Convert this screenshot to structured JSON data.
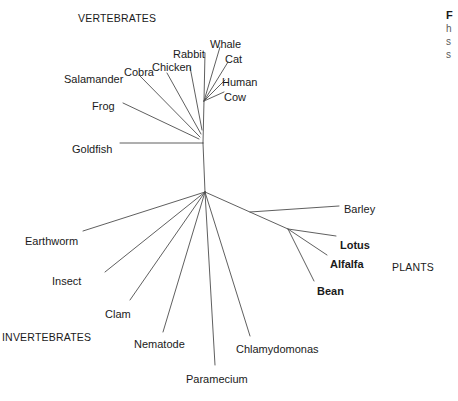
{
  "figure": {
    "type": "unrooted-phylogenetic-tree",
    "background_color": "#ffffff",
    "line_color": "#4d4d4d",
    "text_color": "#1a1a1a"
  },
  "group_labels": [
    {
      "name": "vertebrates",
      "text": "VERTEBRATES",
      "x": 78,
      "y": 12
    },
    {
      "name": "invertebrates",
      "text": "INVERTEBRATES",
      "x": 2,
      "y": 331
    },
    {
      "name": "plants",
      "text": "PLANTS",
      "x": 392,
      "y": 261
    }
  ],
  "tips": [
    {
      "name": "whale",
      "label": "Whale",
      "bold": false,
      "x": 210,
      "y": 38,
      "anchor": "start"
    },
    {
      "name": "rabbit",
      "label": "Rabbit",
      "bold": false,
      "x": 173,
      "y": 48,
      "anchor": "start"
    },
    {
      "name": "cat",
      "label": "Cat",
      "bold": false,
      "x": 225,
      "y": 53,
      "anchor": "start"
    },
    {
      "name": "chicken",
      "label": "Chicken",
      "bold": false,
      "x": 152,
      "y": 61,
      "anchor": "start"
    },
    {
      "name": "cobra",
      "label": "Cobra",
      "bold": false,
      "x": 124,
      "y": 66,
      "anchor": "start"
    },
    {
      "name": "human",
      "label": "Human",
      "bold": false,
      "x": 222,
      "y": 76,
      "anchor": "start"
    },
    {
      "name": "salamander",
      "label": "Salamander",
      "bold": false,
      "x": 64,
      "y": 73,
      "anchor": "start"
    },
    {
      "name": "cow",
      "label": "Cow",
      "bold": false,
      "x": 224,
      "y": 91,
      "anchor": "start"
    },
    {
      "name": "frog",
      "label": "Frog",
      "bold": false,
      "x": 92,
      "y": 100,
      "anchor": "start"
    },
    {
      "name": "goldfish",
      "label": "Goldfish",
      "bold": false,
      "x": 72,
      "y": 143,
      "anchor": "start"
    },
    {
      "name": "barley",
      "label": "Barley",
      "bold": false,
      "x": 344,
      "y": 203,
      "anchor": "start"
    },
    {
      "name": "earthworm",
      "label": "Earthworm",
      "bold": false,
      "x": 25,
      "y": 235,
      "anchor": "start"
    },
    {
      "name": "lotus",
      "label": "Lotus",
      "bold": true,
      "x": 340,
      "y": 239,
      "anchor": "start"
    },
    {
      "name": "alfalfa",
      "label": "Alfalfa",
      "bold": true,
      "x": 330,
      "y": 258,
      "anchor": "start"
    },
    {
      "name": "insect",
      "label": "Insect",
      "bold": false,
      "x": 52,
      "y": 275,
      "anchor": "start"
    },
    {
      "name": "bean",
      "label": "Bean",
      "bold": true,
      "x": 317,
      "y": 285,
      "anchor": "start"
    },
    {
      "name": "clam",
      "label": "Clam",
      "bold": false,
      "x": 105,
      "y": 308,
      "anchor": "start"
    },
    {
      "name": "nematode",
      "label": "Nematode",
      "bold": false,
      "x": 134,
      "y": 338,
      "anchor": "start"
    },
    {
      "name": "chlamydomonas",
      "label": "Chlamydomonas",
      "bold": false,
      "x": 236,
      "y": 343,
      "anchor": "start"
    },
    {
      "name": "paramecium",
      "label": "Paramecium",
      "bold": false,
      "x": 186,
      "y": 373,
      "anchor": "start"
    }
  ],
  "nodes": {
    "root": {
      "x": 205,
      "y": 192
    },
    "vertebrate": {
      "x": 203,
      "y": 143
    },
    "mammal": {
      "x": 204,
      "y": 101
    },
    "plant": {
      "x": 288,
      "y": 229
    }
  },
  "branches": [
    {
      "name": "branch-root-to-vertebrate",
      "x1": 205,
      "y1": 192,
      "x2": 203,
      "y2": 143
    },
    {
      "name": "branch-vertebrate-to-mammal",
      "x1": 203,
      "y1": 143,
      "x2": 204,
      "y2": 101
    },
    {
      "name": "branch-goldfish",
      "x1": 203,
      "y1": 143,
      "x2": 120,
      "y2": 143
    },
    {
      "name": "branch-frog",
      "x1": 199,
      "y1": 139,
      "x2": 123,
      "y2": 103
    },
    {
      "name": "branch-salamander",
      "x1": 200,
      "y1": 137,
      "x2": 140,
      "y2": 76
    },
    {
      "name": "branch-cobra",
      "x1": 201,
      "y1": 134,
      "x2": 167,
      "y2": 73
    },
    {
      "name": "branch-chicken",
      "x1": 202,
      "y1": 130,
      "x2": 190,
      "y2": 67
    },
    {
      "name": "branch-rabbit",
      "x1": 204,
      "y1": 101,
      "x2": 205,
      "y2": 53
    },
    {
      "name": "branch-whale",
      "x1": 204,
      "y1": 101,
      "x2": 220,
      "y2": 47
    },
    {
      "name": "branch-cat",
      "x1": 204,
      "y1": 101,
      "x2": 228,
      "y2": 62
    },
    {
      "name": "branch-human",
      "x1": 204,
      "y1": 101,
      "x2": 225,
      "y2": 80
    },
    {
      "name": "branch-cow",
      "x1": 204,
      "y1": 101,
      "x2": 224,
      "y2": 92
    },
    {
      "name": "branch-earthworm",
      "x1": 205,
      "y1": 192,
      "x2": 83,
      "y2": 231
    },
    {
      "name": "branch-insect",
      "x1": 205,
      "y1": 192,
      "x2": 105,
      "y2": 272
    },
    {
      "name": "branch-clam",
      "x1": 205,
      "y1": 192,
      "x2": 130,
      "y2": 300
    },
    {
      "name": "branch-nematode",
      "x1": 205,
      "y1": 192,
      "x2": 163,
      "y2": 332
    },
    {
      "name": "branch-paramecium",
      "x1": 205,
      "y1": 192,
      "x2": 215,
      "y2": 365
    },
    {
      "name": "branch-chlamydomonas",
      "x1": 205,
      "y1": 192,
      "x2": 250,
      "y2": 336
    },
    {
      "name": "branch-root-to-plant",
      "x1": 205,
      "y1": 192,
      "x2": 288,
      "y2": 229
    },
    {
      "name": "branch-barley",
      "x1": 250,
      "y1": 212,
      "x2": 339,
      "y2": 206
    },
    {
      "name": "branch-lotus",
      "x1": 288,
      "y1": 229,
      "x2": 336,
      "y2": 236
    },
    {
      "name": "branch-alfalfa",
      "x1": 288,
      "y1": 229,
      "x2": 327,
      "y2": 255
    },
    {
      "name": "branch-bean",
      "x1": 288,
      "y1": 229,
      "x2": 314,
      "y2": 281
    }
  ],
  "caption": {
    "title": "F",
    "line2": "h",
    "line3": "s",
    "line4": "s"
  }
}
